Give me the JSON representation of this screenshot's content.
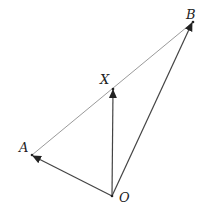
{
  "diagram": {
    "points": {
      "O": {
        "label": "O",
        "x": 112,
        "y": 196
      },
      "A": {
        "label": "A",
        "x": 32,
        "y": 155
      },
      "X": {
        "label": "X",
        "x": 113,
        "y": 89
      },
      "B": {
        "label": "B",
        "x": 193,
        "y": 22
      }
    },
    "vectors": [
      {
        "from": "O",
        "to": "A"
      },
      {
        "from": "O",
        "to": "X"
      },
      {
        "from": "O",
        "to": "B"
      }
    ],
    "segments": [
      {
        "from": "A",
        "to": "B",
        "style": "thin gray line through X"
      }
    ],
    "colors": {
      "line": "#555555",
      "segment": "#9a9a9a",
      "text": "#222222"
    }
  }
}
